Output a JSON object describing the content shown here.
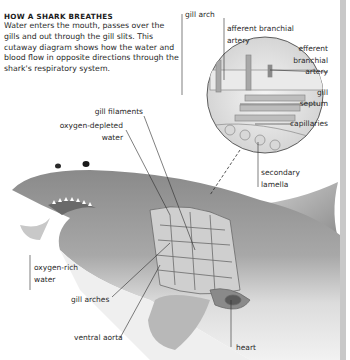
{
  "intro": {
    "heading": "HOW A SHARK BREATHES",
    "body": "Water enters the mouth, passes over the gills and out through the gill slits. This cutaway diagram shows how the water and blood flow in opposite directions through the shark's respiratory system."
  },
  "labels": {
    "gill_arch": "gill arch",
    "afferent_1": "afferent branchial",
    "afferent_2": "artery",
    "efferent_1": "efferent",
    "efferent_2": "branchial",
    "efferent_3": "artery",
    "septum_1": "gill",
    "septum_2": "septum",
    "capillaries": "capillaries",
    "gill_filaments": "gill filaments",
    "o2_depleted_1": "oxygen-depleted",
    "o2_depleted_2": "water",
    "secondary_1": "secondary",
    "secondary_2": "lamella",
    "o2_rich_1": "oxygen-rich",
    "o2_rich_2": "water",
    "gill_arches": "gill arches",
    "ventral_aorta": "ventral aorta",
    "heart": "heart"
  },
  "colors": {
    "background": "#ffffff",
    "text": "#2a2a2a",
    "shark_dark": "#7a7a7a",
    "shark_light": "#d8d8d8",
    "edge_strip": "#c8c8c8"
  }
}
